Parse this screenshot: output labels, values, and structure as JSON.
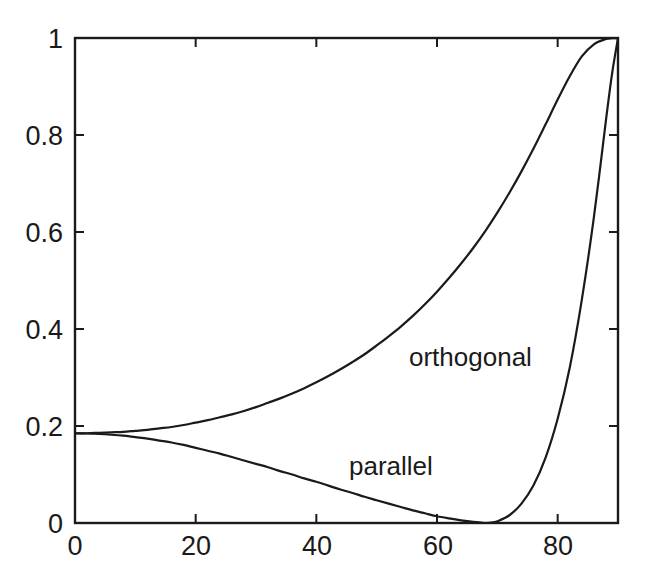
{
  "chart_data": {
    "type": "line",
    "title": "",
    "subtitle": "",
    "xlabel": "",
    "ylabel": "",
    "xlim": [
      0,
      90
    ],
    "ylim": [
      0,
      1
    ],
    "grid": false,
    "legend_position": "inline-annotations",
    "xticks": [
      0,
      20,
      40,
      60,
      80
    ],
    "xtick_labels": [
      "0",
      "20",
      "40",
      "60",
      "80"
    ],
    "yticks": [
      0,
      0.2,
      0.4,
      0.6,
      0.8,
      1
    ],
    "ytick_labels": [
      "0",
      "0.2",
      "0.4",
      "0.6",
      "0.8",
      "1"
    ],
    "annotations": [
      {
        "text": "orthogonal",
        "x": 55,
        "y": 0.33
      },
      {
        "text": "parallel",
        "x": 46,
        "y": 0.145
      }
    ],
    "series": [
      {
        "name": "orthogonal",
        "color": "#1a1a1a",
        "x": [
          0,
          2,
          4,
          6,
          8,
          10,
          12,
          14,
          16,
          18,
          20,
          22,
          24,
          26,
          28,
          30,
          32,
          34,
          36,
          38,
          40,
          42,
          44,
          46,
          48,
          50,
          52,
          54,
          56,
          58,
          60,
          62,
          64,
          66,
          68,
          70,
          72,
          74,
          76,
          78,
          80,
          82,
          84,
          86,
          88,
          89,
          90
        ],
        "values": [
          0.185,
          0.185,
          0.186,
          0.187,
          0.188,
          0.19,
          0.192,
          0.195,
          0.198,
          0.202,
          0.207,
          0.212,
          0.218,
          0.224,
          0.231,
          0.239,
          0.248,
          0.257,
          0.267,
          0.278,
          0.29,
          0.303,
          0.317,
          0.332,
          0.348,
          0.366,
          0.385,
          0.405,
          0.427,
          0.451,
          0.477,
          0.505,
          0.535,
          0.567,
          0.602,
          0.64,
          0.681,
          0.725,
          0.772,
          0.822,
          0.873,
          0.921,
          0.962,
          0.987,
          0.998,
          0.9995,
          1.0
        ]
      },
      {
        "name": "parallel",
        "color": "#1a1a1a",
        "x": [
          0,
          2,
          4,
          6,
          8,
          10,
          12,
          14,
          16,
          18,
          20,
          22,
          24,
          26,
          28,
          30,
          32,
          34,
          36,
          38,
          40,
          42,
          44,
          46,
          48,
          50,
          52,
          54,
          56,
          58,
          60,
          62,
          64,
          66,
          67.5,
          68,
          69,
          70,
          72,
          74,
          76,
          78,
          80,
          82,
          84,
          86,
          88,
          89,
          90
        ],
        "values": [
          0.185,
          0.1845,
          0.1835,
          0.182,
          0.18,
          0.177,
          0.174,
          0.17,
          0.166,
          0.161,
          0.155,
          0.149,
          0.143,
          0.136,
          0.129,
          0.122,
          0.115,
          0.107,
          0.1,
          0.092,
          0.085,
          0.077,
          0.069,
          0.062,
          0.054,
          0.047,
          0.04,
          0.033,
          0.026,
          0.02,
          0.014,
          0.0095,
          0.0055,
          0.0022,
          0.0004,
          0.0,
          0.0008,
          0.0035,
          0.016,
          0.04,
          0.078,
          0.135,
          0.215,
          0.32,
          0.46,
          0.63,
          0.83,
          0.925,
          1.0
        ]
      }
    ]
  },
  "axes": {
    "y_ticks": [
      {
        "label": "1",
        "top": 24
      },
      {
        "label": "0.8",
        "top": 121
      },
      {
        "label": "0.6",
        "top": 218
      },
      {
        "label": "0.4",
        "top": 315
      },
      {
        "label": "0.2",
        "top": 412
      },
      {
        "label": "0",
        "top": 509
      }
    ],
    "x_ticks": [
      {
        "label": "0",
        "left": 75
      },
      {
        "label": "20",
        "left": 196
      },
      {
        "label": "40",
        "left": 317
      },
      {
        "label": "60",
        "left": 438
      },
      {
        "label": "80",
        "left": 558
      }
    ]
  },
  "labels": {
    "orthogonal": "orthogonal",
    "parallel": "parallel"
  },
  "style": {
    "axis_color": "#1a1a1a",
    "curve_color": "#1a1a1a",
    "background": "#ffffff"
  }
}
